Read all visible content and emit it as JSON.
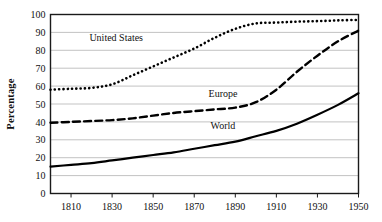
{
  "chart_data": {
    "type": "line",
    "title": "",
    "xlabel": "",
    "ylabel": "Percentage",
    "xlim": [
      1800,
      1950
    ],
    "ylim": [
      0,
      100
    ],
    "grid": true,
    "legend_position": "inline-annotations",
    "x_ticks": [
      "1810",
      "1830",
      "1850",
      "1870",
      "1890",
      "1910",
      "1930",
      "1950"
    ],
    "x_tick_values": [
      1810,
      1830,
      1850,
      1870,
      1890,
      1910,
      1930,
      1950
    ],
    "y_ticks": [
      "0",
      "10",
      "20",
      "30",
      "40",
      "50",
      "60",
      "70",
      "80",
      "90",
      "100"
    ],
    "y_tick_values": [
      0,
      10,
      20,
      30,
      40,
      50,
      60,
      70,
      80,
      90,
      100
    ],
    "x": [
      1800,
      1810,
      1820,
      1830,
      1840,
      1850,
      1860,
      1870,
      1880,
      1890,
      1900,
      1910,
      1920,
      1930,
      1940,
      1950
    ],
    "series": [
      {
        "name": "United States",
        "style": "dotted",
        "color": "#000000",
        "values": [
          58,
          58.5,
          59,
          61,
          66,
          71,
          76,
          81,
          87,
          92,
          95,
          95.5,
          96,
          96.3,
          96.7,
          97
        ]
      },
      {
        "name": "Europe",
        "style": "dashed",
        "color": "#000000",
        "values": [
          39.5,
          40,
          40.5,
          41,
          42,
          43.5,
          45,
          46,
          47,
          48,
          51,
          58,
          68,
          77,
          85,
          91
        ]
      },
      {
        "name": "World",
        "style": "solid",
        "color": "#000000",
        "values": [
          15,
          16,
          17,
          18.5,
          20,
          21.5,
          23,
          25,
          27,
          29,
          32,
          35,
          39,
          44,
          49.5,
          56
        ]
      }
    ],
    "annotations": [
      {
        "text": "United States",
        "x": 1832,
        "y": 85
      },
      {
        "text": "Europe",
        "x": 1884,
        "y": 54
      },
      {
        "text": "World",
        "x": 1884,
        "y": 36
      }
    ]
  }
}
